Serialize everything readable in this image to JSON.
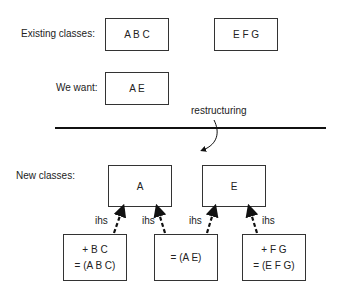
{
  "labels": {
    "existing": "Existing classes:",
    "want": "We want:",
    "restructuring": "restructuring",
    "new": "New classes:"
  },
  "existing_classes": [
    {
      "text": "A B C"
    },
    {
      "text": "E F G"
    }
  ],
  "wanted_class": {
    "text": "A E"
  },
  "new_classes": [
    {
      "text": "A"
    },
    {
      "text": "E"
    }
  ],
  "derived_classes": [
    {
      "lines": [
        "+ B C",
        "= (A B C)"
      ]
    },
    {
      "lines": [
        "= (A E)"
      ]
    },
    {
      "lines": [
        "+ F G",
        "= (E F G)"
      ]
    }
  ],
  "edges": [
    {
      "label": "ihs",
      "from": "derived_0",
      "to": "new_0"
    },
    {
      "label": "ihs",
      "from": "derived_1",
      "to": "new_0"
    },
    {
      "label": "ihs",
      "from": "derived_1",
      "to": "new_1"
    },
    {
      "label": "ihs",
      "from": "derived_2",
      "to": "new_1"
    }
  ]
}
